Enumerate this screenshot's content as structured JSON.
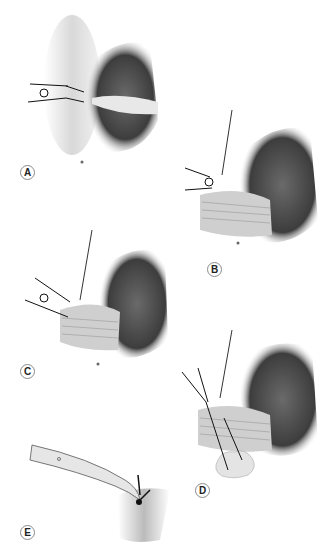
{
  "figure": {
    "type": "surgical-illustration",
    "style": "grayscale shaded drawing",
    "panels": [
      {
        "id": "A",
        "label": "A",
        "description": "Suture placed through tissue edge beside dark rounded organ; two-strand knot on the left"
      },
      {
        "id": "B",
        "label": "B",
        "description": "Suture tied; tissue flap folded over with horizontal striations"
      },
      {
        "id": "C",
        "label": "C",
        "description": "Banded tissue wrap with suture ends pulled to the left"
      },
      {
        "id": "D",
        "label": "D",
        "description": "Two long sutures drawn down through the wrap toward a lobulated fatty mass below"
      },
      {
        "id": "E",
        "label": "E",
        "description": "Curved forceps holding a knotted suture against tissue"
      }
    ]
  },
  "colors": {
    "background": "#ffffff",
    "organ_dark": "#4a4a4a",
    "tissue_light": "#d8d8d8",
    "suture": "#111111",
    "label_border": "#8a8a8a"
  }
}
